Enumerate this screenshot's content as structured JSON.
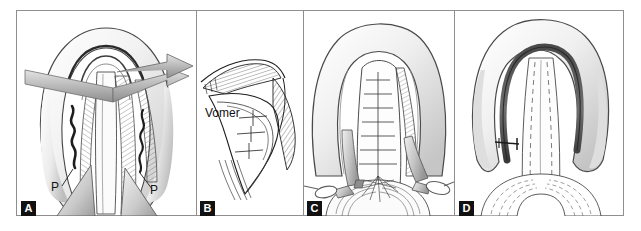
{
  "figure": {
    "panel_count": 4,
    "background_color": "#ffffff",
    "border_color": "#8e8e8e",
    "ink_color": "#1a1a1a",
    "shade_light": "#efefef",
    "shade_mid": "#cfcfcf",
    "shade_dark": "#6b6b6b"
  },
  "panels": [
    {
      "label": "A",
      "title": "Palate with relaxing incisions and transposed flaps",
      "annotations": [
        {
          "text": "P",
          "name": "annotation-p-left"
        },
        {
          "text": "P",
          "name": "annotation-p-right"
        }
      ],
      "features": [
        "palatal arch",
        "gray directional arrow",
        "zigzag relaxing incisions",
        "hatched muscle layer",
        "triangular mucosal flaps"
      ]
    },
    {
      "label": "B",
      "title": "Line detail of vomer flap elevation",
      "annotations": [
        {
          "text": "Vomer",
          "name": "annotation-vomer"
        }
      ],
      "features": [
        "vomer outline",
        "hatched periosteum",
        "cross suture marks"
      ]
    },
    {
      "label": "C",
      "title": "Retracted palate during closure",
      "annotations": [],
      "features": [
        "U-shaped palatal arch",
        "interrupted suture ladder",
        "ring-handled retractors",
        "tongue base hatching"
      ]
    },
    {
      "label": "D",
      "title": "Completed two-layer closure",
      "annotations": [
        {
          "text": "x",
          "name": "annotation-suture-x"
        }
      ],
      "features": [
        "dark sutured arch line",
        "dashed closed flap margins",
        "uvula base"
      ]
    }
  ]
}
